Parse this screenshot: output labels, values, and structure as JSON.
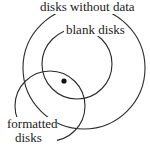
{
  "diagram": {
    "type": "venn",
    "sets": [
      {
        "name": "outer-circle",
        "label": "disks without data",
        "cx": 84,
        "cy": 68,
        "r": 61
      },
      {
        "name": "inner-circle",
        "label": "blank disks",
        "cx": 77,
        "cy": 64,
        "r": 35
      },
      {
        "name": "lower-circle",
        "label_line1": "formatted",
        "label_line2": "disks",
        "cx": 50,
        "cy": 106,
        "r": 35
      }
    ],
    "point": {
      "cx": 64,
      "cy": 81,
      "r": 2.6
    },
    "stroke_color": "#2a2a2a"
  }
}
